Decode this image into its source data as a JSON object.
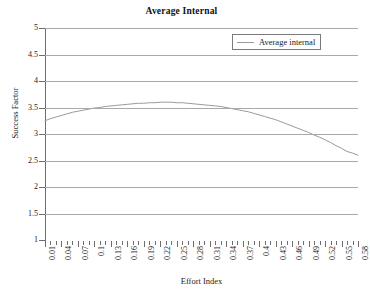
{
  "chart_data": {
    "type": "line",
    "title": "Average Internal",
    "xlabel": "Effort Index",
    "ylabel": "Success Factor",
    "grid": true,
    "legend_position": "top-right",
    "xlim": [
      0.01,
      0.58
    ],
    "ylim": [
      1,
      5
    ],
    "yticks": [
      "5",
      "4.5",
      "4",
      "3.5",
      "3",
      "2.5",
      "2",
      "1.5",
      "1"
    ],
    "ytick_values": [
      5,
      4.5,
      4,
      3.5,
      3,
      2.5,
      2,
      1.5,
      1
    ],
    "xtick_labels": [
      "0.01",
      "0.04",
      "0.07",
      "0.1",
      "0.13",
      "0.16",
      "0.19",
      "0.22",
      "0.25",
      "0.28",
      "0.31",
      "0.34",
      "0.37",
      "0.4",
      "0.43",
      "0.46",
      "0.49",
      "0.52",
      "0.55",
      "0.58"
    ],
    "xtick_label_step": 3,
    "series": [
      {
        "name": "Average internal",
        "color": "#9a9a9a",
        "x": [
          0.01,
          0.02,
          0.03,
          0.04,
          0.05,
          0.06,
          0.07,
          0.08,
          0.09,
          0.1,
          0.11,
          0.12,
          0.13,
          0.14,
          0.15,
          0.16,
          0.17,
          0.18,
          0.19,
          0.2,
          0.21,
          0.22,
          0.23,
          0.24,
          0.25,
          0.26,
          0.27,
          0.28,
          0.29,
          0.3,
          0.31,
          0.32,
          0.33,
          0.34,
          0.35,
          0.36,
          0.37,
          0.38,
          0.39,
          0.4,
          0.41,
          0.42,
          0.43,
          0.44,
          0.45,
          0.46,
          0.47,
          0.48,
          0.49,
          0.5,
          0.51,
          0.52,
          0.53,
          0.54,
          0.55,
          0.56,
          0.57,
          0.58
        ],
        "values": [
          3.25,
          3.29,
          3.32,
          3.35,
          3.38,
          3.41,
          3.43,
          3.45,
          3.47,
          3.49,
          3.5,
          3.52,
          3.53,
          3.54,
          3.55,
          3.56,
          3.57,
          3.58,
          3.58,
          3.59,
          3.59,
          3.6,
          3.6,
          3.6,
          3.59,
          3.59,
          3.58,
          3.57,
          3.56,
          3.55,
          3.54,
          3.53,
          3.52,
          3.5,
          3.48,
          3.46,
          3.44,
          3.42,
          3.39,
          3.36,
          3.33,
          3.3,
          3.27,
          3.23,
          3.19,
          3.15,
          3.11,
          3.07,
          3.03,
          2.98,
          2.94,
          2.89,
          2.84,
          2.78,
          2.73,
          2.67,
          2.64,
          2.6
        ]
      }
    ]
  },
  "legend": {
    "entries": [
      {
        "label": "Average internal"
      }
    ]
  }
}
